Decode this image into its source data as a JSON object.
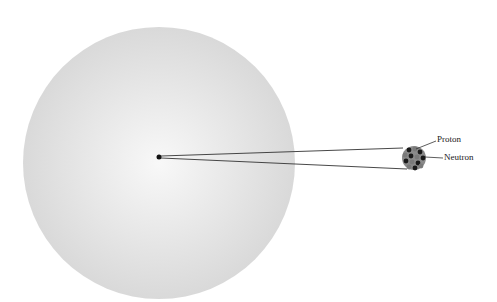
{
  "diagram": {
    "labels": {
      "proton": "Proton",
      "neutron": "Neutron"
    },
    "colors": {
      "atom_fill_center": "#f7f7f7",
      "atom_fill_edge": "#dcdcdc",
      "proton": "#6e6e6e",
      "neutron": "#1a1a1a",
      "line": "#333333"
    }
  }
}
